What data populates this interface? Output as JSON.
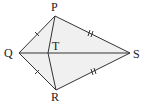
{
  "diagram": {
    "type": "kite",
    "fill_color": "#f0f0f0",
    "stroke_color": "#333333",
    "points": {
      "P": {
        "label": "P",
        "x": 55,
        "y": 16
      },
      "Q": {
        "label": "Q",
        "x": 19,
        "y": 53
      },
      "R": {
        "label": "R",
        "x": 56,
        "y": 90
      },
      "S": {
        "label": "S",
        "x": 130,
        "y": 53
      },
      "T": {
        "label": "T",
        "x": 48,
        "y": 53
      }
    },
    "segments": [
      "PQ",
      "QR",
      "RS",
      "SP",
      "QS",
      "PT",
      "TR"
    ],
    "tick_marks": {
      "single": [
        "PQ",
        "QR"
      ],
      "double": [
        "PS",
        "RS"
      ]
    }
  }
}
